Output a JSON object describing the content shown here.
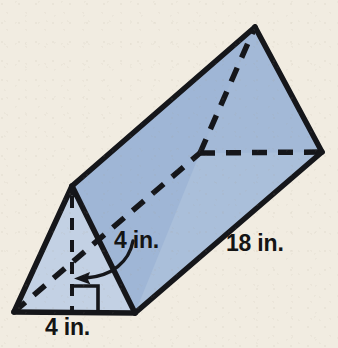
{
  "figure": {
    "name": "triangular-prism",
    "background_color": "#f1ece1",
    "outline_color": "#15161a",
    "face_colors": {
      "top_face": "#9fb6d6",
      "right_face": "#a8bdd9",
      "front_triangle": "#c2d0e3",
      "back_triangle": "#a3b9d7"
    }
  },
  "labels": {
    "slant_height": "4 in.",
    "length": "18 in.",
    "base": "4 in."
  },
  "geometry": {
    "front_triangle": {
      "apex": [
        72,
        186
      ],
      "bottom_left": [
        14,
        312
      ],
      "bottom_right": [
        135,
        313
      ]
    },
    "back_triangle": {
      "apex": [
        255,
        27
      ],
      "right_vertex": [
        322,
        152
      ],
      "hidden_vertex": [
        200,
        153
      ]
    },
    "height_segment": {
      "from": [
        72,
        186
      ],
      "to": [
        72,
        312
      ],
      "style": "dashed",
      "arrow": "up"
    },
    "right_angle_marker": {
      "corner": [
        72,
        312
      ],
      "size": 26
    },
    "callout_arrow": {
      "from": [
        132,
        243
      ],
      "to": [
        78,
        277
      ],
      "style": "curved"
    }
  },
  "annotations": {
    "right_angle": "right-angle-marker",
    "height_arrow": "height-arrow-icon",
    "callout": "callout-arrow-icon"
  }
}
